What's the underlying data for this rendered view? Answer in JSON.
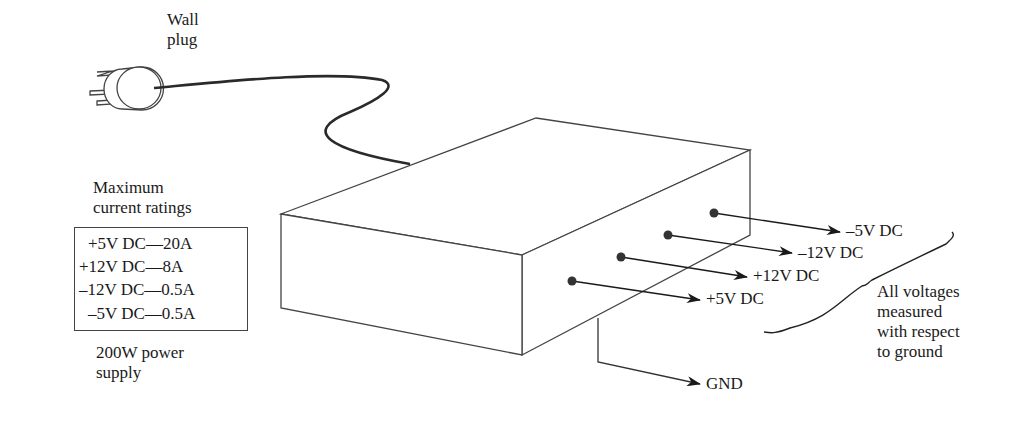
{
  "diagram": {
    "plug_label_line1": "Wall",
    "plug_label_line2": "plug",
    "ratings_title_line1": "Maximum",
    "ratings_title_line2": "current ratings",
    "ratings": [
      {
        "text": "+5V DC—20A"
      },
      {
        "text": "+12V DC—8A"
      },
      {
        "text": "–12V DC—0.5A"
      },
      {
        "text": "–5V DC—0.5A"
      }
    ],
    "supply_caption_line1": "200W power",
    "supply_caption_line2": "supply",
    "outputs": [
      {
        "label": "–5V DC"
      },
      {
        "label": "–12V DC"
      },
      {
        "label": "+12V DC"
      },
      {
        "label": "+5V DC"
      }
    ],
    "ground_label": "GND",
    "note_line1": "All voltages",
    "note_line2": "measured",
    "note_line3": "with respect",
    "note_line4": "to ground",
    "colors": {
      "line": "#444444",
      "cord": "#2a2a2a",
      "dot": "#333333",
      "text": "#1a1a1a"
    }
  }
}
